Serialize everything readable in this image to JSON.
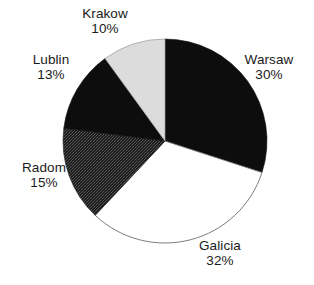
{
  "chart_data": {
    "type": "pie",
    "title": "",
    "categories": [
      "Warsaw",
      "Galicia",
      "Radom",
      "Lublin",
      "Krakow"
    ],
    "values": [
      30,
      32,
      15,
      13,
      10
    ],
    "unit": "%",
    "legend": "none",
    "labels_position": "outside",
    "start_angle_deg": 0,
    "direction": "clockwise",
    "slices": [
      {
        "name": "Warsaw",
        "value": 30,
        "label": "Warsaw",
        "percent_text": "30%",
        "fill": "#0d0d0d",
        "pattern": "solid",
        "start_deg": 0,
        "end_deg": 108
      },
      {
        "name": "Galicia",
        "value": 32,
        "label": "Galicia",
        "percent_text": "32%",
        "fill": "#ffffff",
        "pattern": "solid",
        "start_deg": 108,
        "end_deg": 223.2
      },
      {
        "name": "Radom",
        "value": 15,
        "label": "Radom",
        "percent_text": "15%",
        "fill": "#2a2a2a",
        "pattern": "dither",
        "start_deg": 223.2,
        "end_deg": 277.2
      },
      {
        "name": "Lublin",
        "value": 13,
        "label": "Lublin",
        "percent_text": "13%",
        "fill": "#0d0d0d",
        "pattern": "solid",
        "start_deg": 277.2,
        "end_deg": 324
      },
      {
        "name": "Krakow",
        "value": 10,
        "label": "Krakow",
        "percent_text": "10%",
        "fill": "#dcdcdc",
        "pattern": "solid",
        "start_deg": 324,
        "end_deg": 360
      }
    ],
    "colors": {
      "black": "#0d0d0d",
      "white": "#ffffff",
      "light_gray": "#dcdcdc",
      "dark_texture": "#2a2a2a",
      "outline": "#6e6e6e",
      "text": "#1a1a1a",
      "background": "#ffffff"
    },
    "geometry": {
      "center_x": 165,
      "center_y": 141,
      "radius": 102
    }
  }
}
